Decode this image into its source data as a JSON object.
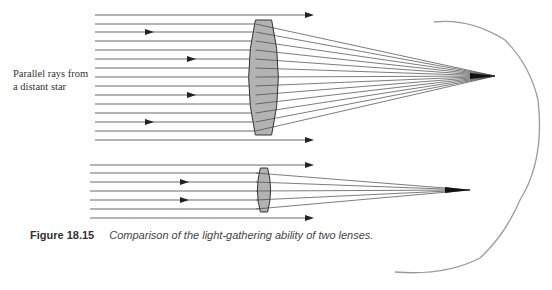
{
  "label": {
    "line1": "Parallel rays from",
    "line2": "a distant star"
  },
  "caption": {
    "number": "Figure 18.15",
    "text": "Comparison of the light-gathering ability of two lenses."
  },
  "diagram": {
    "large_lens": {
      "x_left": 250,
      "x_right": 277,
      "y_top": 20,
      "y_bottom": 135,
      "focus": [
        495,
        76
      ],
      "ray_y": [
        15,
        24,
        32,
        41,
        50,
        59,
        68,
        77,
        86,
        95,
        104,
        113,
        122,
        131,
        140
      ]
    },
    "small_lens": {
      "x_left": 258,
      "x_right": 270,
      "y_top": 168,
      "y_bottom": 212,
      "focus": [
        470,
        190
      ],
      "ray_y": [
        165,
        173,
        182,
        191,
        200,
        209,
        218
      ]
    },
    "colors": {
      "lens_fill": "#b3b3b3",
      "line": "#444444",
      "page_curve": "#999999"
    }
  }
}
